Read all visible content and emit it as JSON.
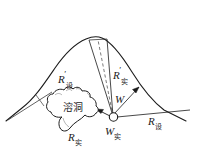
{
  "figure": {
    "type": "geological-cross-section-diagram",
    "background_color": "#ffffff",
    "line_color": "#1b1b1b"
  },
  "labels": {
    "r_design_prime": {
      "symbol": "R",
      "prime": "′",
      "subscript": "设",
      "full": "R′设"
    },
    "r_actual_prime": {
      "symbol": "R",
      "prime": "′",
      "subscript": "实",
      "full": "R′实"
    },
    "w_mid": {
      "symbol": "W",
      "prime": "",
      "subscript": "",
      "full": "W"
    },
    "w_actual": {
      "symbol": "W",
      "prime": "",
      "subscript": "实",
      "full": "W实"
    },
    "r_actual": {
      "symbol": "R",
      "prime": "",
      "subscript": "实",
      "full": "R实"
    },
    "r_design": {
      "symbol": "R",
      "prime": "",
      "subscript": "设",
      "full": "R设"
    },
    "cave": {
      "text": "溶洞"
    }
  },
  "elements": {
    "mountain_outline": "curved hill profile",
    "cave_outline": "irregular closed blob",
    "survey_point": "small open circle",
    "dashed_line": "vertical dashed line to summit",
    "arrows": [
      "arrow pointing left to cave",
      "arrow pointing up-right to slope"
    ]
  }
}
